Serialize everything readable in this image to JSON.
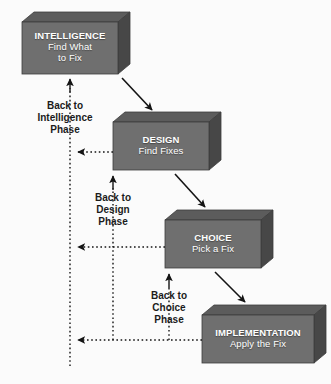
{
  "diagram": {
    "type": "process-flow-with-feedback",
    "background_color": "#fbfbfb",
    "box_face_color": "#6e6e6e",
    "box_top_color": "#5a5a5a",
    "box_side_color": "#4a4a4a",
    "box_text_color": "#ffffff",
    "line_color": "#1b1b1b"
  },
  "boxes": [
    {
      "id": "intelligence",
      "title": "INTELLIGENCE",
      "subtitle_line1": "Find What",
      "subtitle_line2": "to Fix",
      "x": 22,
      "y": 22,
      "w": 96,
      "h": 52
    },
    {
      "id": "design",
      "title": "DESIGN",
      "subtitle_line1": "Find Fixes",
      "subtitle_line2": "",
      "x": 113,
      "y": 122,
      "w": 96,
      "h": 48
    },
    {
      "id": "choice",
      "title": "CHOICE",
      "subtitle_line1": "Pick a Fix",
      "subtitle_line2": "",
      "x": 165,
      "y": 220,
      "w": 96,
      "h": 48
    },
    {
      "id": "implementation",
      "title": "IMPLEMENTATION",
      "subtitle_line1": "Apply the Fix",
      "subtitle_line2": "",
      "x": 202,
      "y": 315,
      "w": 112,
      "h": 48
    }
  ],
  "feedback_labels": [
    {
      "id": "back-to-intelligence",
      "line1": "Back to",
      "line2": "Intelligence",
      "line3": "Phase",
      "x": 28,
      "y": 100
    },
    {
      "id": "back-to-design",
      "line1": "Back to",
      "line2": "Design",
      "line3": "Phase",
      "x": 84,
      "y": 192
    },
    {
      "id": "back-to-choice",
      "line1": "Back to",
      "line2": "Choice",
      "line3": "Phase",
      "x": 140,
      "y": 290
    }
  ],
  "forward_arrows": [
    {
      "id": "intelligence-to-design",
      "from": "intelligence",
      "to": "design",
      "style": "solid"
    },
    {
      "id": "design-to-choice",
      "from": "design",
      "to": "choice",
      "style": "solid"
    },
    {
      "id": "choice-to-implementation",
      "from": "choice",
      "to": "implementation",
      "style": "solid"
    }
  ],
  "feedback_arrows": [
    {
      "id": "design-back-to-intelligence",
      "from": "design",
      "to": "intelligence",
      "style": "dotted"
    },
    {
      "id": "choice-back-to-intelligence",
      "from": "choice",
      "to": "intelligence",
      "style": "dotted"
    },
    {
      "id": "implementation-back-to-intelligence",
      "from": "implementation",
      "to": "intelligence",
      "style": "dotted"
    },
    {
      "id": "choice-back-to-design",
      "from": "choice",
      "to": "design",
      "style": "dotted"
    },
    {
      "id": "implementation-back-to-choice",
      "from": "implementation",
      "to": "choice",
      "style": "dotted"
    }
  ]
}
